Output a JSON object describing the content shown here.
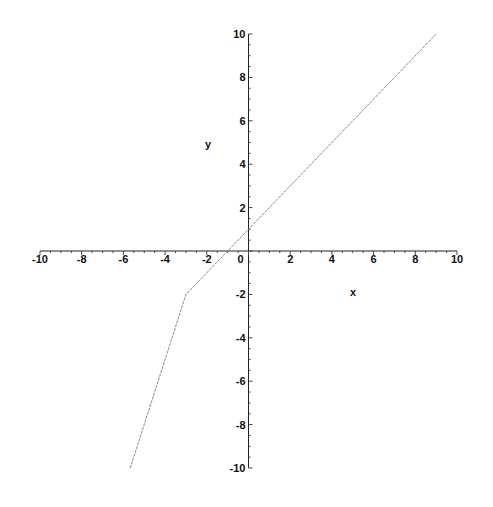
{
  "chart_data": {
    "type": "line",
    "title": "",
    "xlabel": "x",
    "ylabel": "y",
    "xlim": [
      -10,
      10
    ],
    "ylim": [
      -10,
      10
    ],
    "grid": false,
    "legend": null,
    "x_ticks": [
      -10,
      -8,
      -6,
      -4,
      -2,
      0,
      2,
      4,
      6,
      8,
      10
    ],
    "y_ticks": [
      -10,
      -8,
      -6,
      -4,
      -2,
      2,
      4,
      6,
      8,
      10
    ],
    "x_tick_labels": [
      "-10",
      "-8",
      "-6",
      "-4",
      "-2",
      "0",
      "2",
      "4",
      "6",
      "8",
      "10"
    ],
    "y_tick_labels": [
      "-10",
      "-8",
      "-6",
      "-4",
      "-2",
      "2",
      "4",
      "6",
      "8",
      "10"
    ],
    "series": [
      {
        "name": "piecewise",
        "color": "#888888",
        "x": [
          -5.67,
          -3,
          9
        ],
        "y": [
          -10,
          -2,
          10
        ]
      }
    ]
  }
}
